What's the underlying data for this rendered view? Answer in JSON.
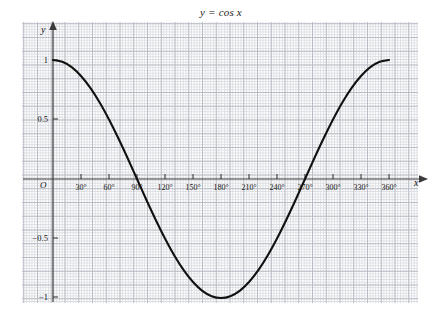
{
  "chart_data": {
    "type": "line",
    "title": "y = cos x",
    "xlabel": "x",
    "ylabel": "y",
    "origin_label": "O",
    "xlim": [
      0,
      360
    ],
    "ylim": [
      -1,
      1
    ],
    "grid": true,
    "grid_style": "graph-paper",
    "legend": null,
    "x_tick_labels": [
      "30°",
      "60°",
      "90°",
      "120°",
      "150°",
      "180°",
      "210°",
      "240°",
      "270°",
      "300°",
      "330°",
      "360°"
    ],
    "x_ticks": [
      30,
      60,
      90,
      120,
      150,
      180,
      210,
      240,
      270,
      300,
      330,
      360
    ],
    "y_tick_labels": [
      "1",
      "0.5",
      "−0.5",
      "−1"
    ],
    "y_ticks": [
      1,
      0.5,
      -0.5,
      -1
    ],
    "series": [
      {
        "name": "y = cos x",
        "color": "#111111",
        "x": [
          0,
          10,
          20,
          30,
          40,
          50,
          60,
          70,
          80,
          90,
          100,
          110,
          120,
          130,
          140,
          150,
          160,
          170,
          180,
          190,
          200,
          210,
          220,
          230,
          240,
          250,
          260,
          270,
          280,
          290,
          300,
          310,
          320,
          330,
          340,
          350,
          360
        ],
        "values": [
          1,
          0.985,
          0.94,
          0.866,
          0.766,
          0.643,
          0.5,
          0.342,
          0.174,
          0,
          -0.174,
          -0.342,
          -0.5,
          -0.643,
          -0.766,
          -0.866,
          -0.94,
          -0.985,
          -1,
          -0.985,
          -0.94,
          -0.866,
          -0.766,
          -0.643,
          -0.5,
          -0.342,
          -0.174,
          0,
          0.174,
          0.342,
          0.5,
          0.643,
          0.766,
          0.866,
          0.94,
          0.985,
          1
        ]
      }
    ]
  },
  "colors": {
    "curve": "#111111",
    "axis": "#3a3a3a",
    "grid_minor": "#dcdee3",
    "grid_major": "#b9bcc4",
    "background": "#ffffff"
  }
}
